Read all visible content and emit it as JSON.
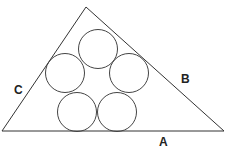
{
  "diagram": {
    "triangle": {
      "apex": [
        86,
        7
      ],
      "left": [
        2,
        131
      ],
      "right": [
        224,
        131
      ],
      "stroke": "#333333"
    },
    "circles": [
      {
        "cx": 98,
        "cy": 49,
        "r": 19.5
      },
      {
        "cx": 65,
        "cy": 73,
        "r": 19.5
      },
      {
        "cx": 129,
        "cy": 73,
        "r": 19.5
      },
      {
        "cx": 77,
        "cy": 112,
        "r": 19.5
      },
      {
        "cx": 117,
        "cy": 112,
        "r": 19.5
      }
    ],
    "labels": {
      "a": "A",
      "b": "B",
      "c": "C"
    }
  }
}
